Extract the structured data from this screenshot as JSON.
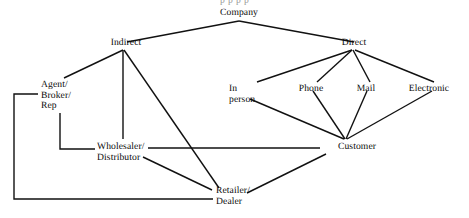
{
  "diagram": {
    "clipped_header": "p p  p p",
    "stroke_color": "#111111",
    "text_color": "#0a0a0a",
    "background_color": "#ffffff",
    "nodes": [
      {
        "id": "company",
        "label": "Company",
        "x": 239,
        "y": 8,
        "align": "center"
      },
      {
        "id": "indirect",
        "label": "Indirect",
        "x": 126,
        "y": 38,
        "align": "center"
      },
      {
        "id": "direct",
        "label": "Direct",
        "x": 354,
        "y": 38,
        "align": "center"
      },
      {
        "id": "agent",
        "label": "Agent/\nBroker/\nRep",
        "x": 41,
        "y": 80,
        "align": "left"
      },
      {
        "id": "inperson",
        "label": "In\nperson",
        "x": 229,
        "y": 84,
        "align": "left"
      },
      {
        "id": "phone",
        "label": "Phone",
        "x": 311,
        "y": 84,
        "align": "center"
      },
      {
        "id": "mail",
        "label": "Mail",
        "x": 366,
        "y": 84,
        "align": "center"
      },
      {
        "id": "electronic",
        "label": "Electronic",
        "x": 429,
        "y": 84,
        "align": "center"
      },
      {
        "id": "wholesaler",
        "label": "Wholesaler/\nDistributor",
        "x": 97,
        "y": 142,
        "align": "left"
      },
      {
        "id": "customer",
        "label": "Customer",
        "x": 357,
        "y": 142,
        "align": "center"
      },
      {
        "id": "retailer",
        "label": "Retailer/\nDealer",
        "x": 216,
        "y": 186,
        "align": "left"
      }
    ],
    "edges": [
      {
        "id": "company-indirect",
        "from": "company",
        "to": "indirect",
        "kind": "line",
        "points": "239,21 127,42"
      },
      {
        "id": "company-direct",
        "from": "company",
        "to": "direct",
        "kind": "line",
        "points": "239,21 354,42"
      },
      {
        "id": "indirect-agent",
        "from": "indirect",
        "to": "agent",
        "kind": "line",
        "points": "123,50 64,78"
      },
      {
        "id": "indirect-wholesaler",
        "from": "indirect",
        "to": "wholesaler",
        "kind": "line",
        "points": "123,50 123,139"
      },
      {
        "id": "indirect-retailer",
        "from": "indirect",
        "to": "retailer",
        "kind": "line",
        "points": "124,50 219,188"
      },
      {
        "id": "agent-wholesaler",
        "from": "agent",
        "to": "wholesaler",
        "kind": "elbow",
        "points": "60,113 60,149 95,149"
      },
      {
        "id": "agent-retailer",
        "from": "agent",
        "to": "retailer",
        "kind": "elbow",
        "points": "38,94 14,94 14,199 213,199"
      },
      {
        "id": "wholesaler-customer",
        "from": "wholesaler",
        "to": "customer",
        "kind": "line",
        "points": "148,148 320,148"
      },
      {
        "id": "wholesaler-retailer",
        "from": "wholesaler",
        "to": "retailer",
        "kind": "line",
        "points": "143,157 212,190"
      },
      {
        "id": "direct-inperson",
        "from": "direct",
        "to": "inperson",
        "kind": "line",
        "points": "352,50 257,82"
      },
      {
        "id": "direct-phone",
        "from": "direct",
        "to": "phone",
        "kind": "line",
        "points": "352,50 317,82"
      },
      {
        "id": "direct-mail",
        "from": "direct",
        "to": "mail",
        "kind": "line",
        "points": "353,50 370,82"
      },
      {
        "id": "direct-electronic",
        "from": "direct",
        "to": "electronic",
        "kind": "line",
        "points": "355,50 434,82"
      },
      {
        "id": "inperson-customer",
        "from": "inperson",
        "to": "customer",
        "kind": "line",
        "points": "250,99 344,139"
      },
      {
        "id": "phone-customer",
        "from": "phone",
        "to": "customer",
        "kind": "line",
        "points": "313,91 345,139"
      },
      {
        "id": "mail-customer",
        "from": "mail",
        "to": "customer",
        "kind": "line",
        "points": "367,91 346,139"
      },
      {
        "id": "electronic-customer",
        "from": "electronic",
        "to": "customer",
        "kind": "line",
        "points": "432,91 347,139"
      },
      {
        "id": "customer-retailer",
        "from": "customer",
        "to": "retailer",
        "kind": "line",
        "points": "326,154 247,193"
      }
    ]
  }
}
